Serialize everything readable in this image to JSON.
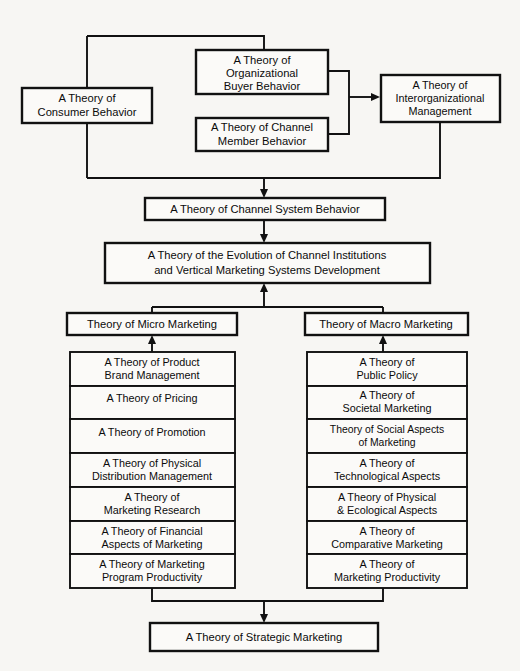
{
  "diagram": {
    "title": "A Theory of Strategic Marketing",
    "type": "hierarchy-flowchart",
    "colors": {
      "background": "#f7f6f3",
      "box_fill": "#fbfaf8",
      "line": "#111111",
      "text": "#0b0b0b"
    },
    "top_level": {
      "consumer_behavior": {
        "line1": "A Theory of",
        "line2": "Consumer Behavior"
      },
      "organizational_buyer_behavior": {
        "line1": "A Theory of",
        "line2": "Organizational",
        "line3": "Buyer Behavior"
      },
      "channel_member_behavior": {
        "line1": "A Theory of Channel",
        "line2": "Member Behavior"
      },
      "interorganizational_management": {
        "line1": "A Theory of",
        "line2": "Interorganizational",
        "line3": "Management"
      }
    },
    "mid_level": {
      "channel_system_behavior": {
        "line1": "A Theory of Channel System Behavior"
      },
      "evolution_channel_institutions": {
        "line1": "A Theory of the Evolution of Channel Institutions",
        "line2": "and Vertical Marketing Systems Development"
      },
      "micro_marketing": {
        "line1": "Theory of Micro Marketing"
      },
      "macro_marketing": {
        "line1": "Theory of Macro Marketing"
      }
    },
    "micro_column": [
      {
        "line1": "A Theory of Product",
        "line2": "Brand Management"
      },
      {
        "line1": "A Theory of Pricing",
        "line2": ""
      },
      {
        "line1": "A Theory of Promotion",
        "line2": ""
      },
      {
        "line1": "A Theory of Physical",
        "line2": "Distribution Management"
      },
      {
        "line1": "A Theory of",
        "line2": "Marketing Research"
      },
      {
        "line1": "A Theory of Financial",
        "line2": "Aspects of Marketing"
      },
      {
        "line1": "A Theory of Marketing",
        "line2": "Program Productivity"
      }
    ],
    "macro_column": [
      {
        "line1": "A Theory of",
        "line2": "Public Policy"
      },
      {
        "line1": "A Theory of",
        "line2": "Societal Marketing"
      },
      {
        "line1": "Theory of Social Aspects",
        "line2": "of Marketing"
      },
      {
        "line1": "A Theory of",
        "line2": "Technological Aspects"
      },
      {
        "line1": "A Theory of Physical",
        "line2": "& Ecological Aspects"
      },
      {
        "line1": "A Theory of",
        "line2": "Comparative Marketing"
      },
      {
        "line1": "A Theory of",
        "line2": "Marketing Productivity"
      }
    ],
    "bottom_level": {
      "strategic_marketing": {
        "line1": "A Theory of Strategic Marketing"
      }
    }
  }
}
